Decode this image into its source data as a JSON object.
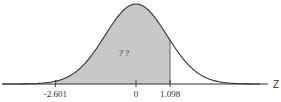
{
  "chart_data": {
    "type": "area",
    "title": "",
    "xlabel": "Z",
    "ylabel": "",
    "xlim": [
      -4,
      4.6
    ],
    "mean": 0,
    "sd": 1,
    "shaded_region": {
      "from": -2.601,
      "to": 1.098
    },
    "area_label": "? ?",
    "ticks": [
      {
        "value": -2.601,
        "label": "-2.601"
      },
      {
        "value": 0,
        "label": "0"
      },
      {
        "value": 1.098,
        "label": "1.098"
      }
    ],
    "colors": {
      "fill": "#c8c8c8",
      "curve": "#333333",
      "axis": "#333333"
    }
  }
}
